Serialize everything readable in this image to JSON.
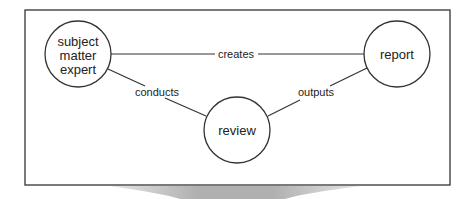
{
  "diagram": {
    "nodes": [
      {
        "id": "sme",
        "lines": [
          "subject",
          "matter",
          "expert"
        ]
      },
      {
        "id": "report",
        "lines": [
          "report"
        ]
      },
      {
        "id": "review",
        "lines": [
          "review"
        ]
      }
    ],
    "edges": [
      {
        "from": "sme",
        "to": "report",
        "label": "creates"
      },
      {
        "from": "sme",
        "to": "review",
        "label": "conducts"
      },
      {
        "from": "review",
        "to": "report",
        "label": "outputs"
      }
    ]
  },
  "colors": {
    "stroke": "#333333",
    "shadow": "#b5b5b5",
    "background": "#ffffff"
  }
}
